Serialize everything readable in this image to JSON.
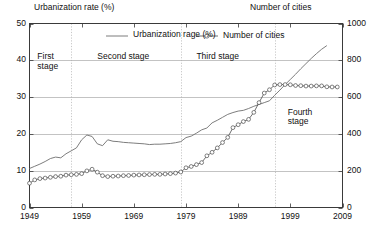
{
  "chart_data": {
    "type": "line",
    "title": "",
    "left_axis": {
      "label": "Urbanization rate (%)",
      "ticks": [
        0,
        10,
        20,
        30,
        40,
        50
      ],
      "ylim": [
        0,
        50
      ]
    },
    "right_axis": {
      "label": "Number of cities",
      "ticks": [
        0,
        200,
        400,
        600,
        800,
        1000
      ],
      "ylim": [
        0,
        1000
      ]
    },
    "xlabel": "",
    "xticks": [
      1949,
      1959,
      1969,
      1979,
      1989,
      1999,
      2009
    ],
    "xlim": [
      1949,
      2009
    ],
    "grid": true,
    "legend": [
      {
        "name": "Urbanization rage (%)",
        "marker": "line",
        "axis": "left"
      },
      {
        "name": "Number of cities",
        "marker": "line-circle",
        "axis": "right"
      }
    ],
    "legend_position": "inside-top",
    "annotations": [
      {
        "text": "First\nstage",
        "x": 1950.5,
        "y_frac": 0.8,
        "span": [
          1949,
          1957
        ]
      },
      {
        "text": "Second stage",
        "x": 1962,
        "y_frac": 0.8,
        "span": [
          1957,
          1978
        ]
      },
      {
        "text": "Third stage",
        "x": 1981,
        "y_frac": 0.8,
        "span": [
          1978,
          1996
        ]
      },
      {
        "text": "Fourth\nstage",
        "x": 1998.5,
        "y_frac": 0.5,
        "span": [
          1996,
          2009
        ]
      }
    ],
    "dividers_x": [
      1957,
      1978,
      1996
    ],
    "series": [
      {
        "name": "Urbanization rage (%)",
        "axis": "left",
        "marker": "none",
        "x": [
          1949,
          1950,
          1951,
          1952,
          1953,
          1954,
          1955,
          1956,
          1957,
          1958,
          1959,
          1960,
          1961,
          1962,
          1963,
          1964,
          1965,
          1966,
          1967,
          1968,
          1969,
          1970,
          1971,
          1972,
          1973,
          1974,
          1975,
          1976,
          1977,
          1978,
          1979,
          1980,
          1981,
          1982,
          1983,
          1984,
          1985,
          1986,
          1987,
          1988,
          1989,
          1990,
          1991,
          1992,
          1993,
          1994,
          1995,
          1996,
          1997,
          1998,
          1999,
          2000,
          2001,
          2002,
          2003,
          2004,
          2005,
          2006
        ],
        "values": [
          10.6,
          11.2,
          11.8,
          12.5,
          13.3,
          13.7,
          13.5,
          14.6,
          15.4,
          16.2,
          18.4,
          19.7,
          19.3,
          17.3,
          16.8,
          18.4,
          18.0,
          17.9,
          17.7,
          17.6,
          17.5,
          17.4,
          17.3,
          17.1,
          17.2,
          17.2,
          17.3,
          17.4,
          17.6,
          17.9,
          19.0,
          19.4,
          20.2,
          21.1,
          21.6,
          23.0,
          23.7,
          24.5,
          25.3,
          25.8,
          26.2,
          26.4,
          26.9,
          27.5,
          28.0,
          28.5,
          29.0,
          30.5,
          31.9,
          33.4,
          34.8,
          36.2,
          37.7,
          39.1,
          40.5,
          41.8,
          43.0,
          44.0
        ],
        "color": "#6e6e6e"
      },
      {
        "name": "Number of cities",
        "axis": "right",
        "marker": "circle",
        "x": [
          1949,
          1950,
          1951,
          1952,
          1953,
          1954,
          1955,
          1956,
          1957,
          1958,
          1959,
          1960,
          1961,
          1962,
          1963,
          1964,
          1965,
          1966,
          1967,
          1968,
          1969,
          1970,
          1971,
          1972,
          1973,
          1974,
          1975,
          1976,
          1977,
          1978,
          1979,
          1980,
          1981,
          1982,
          1983,
          1984,
          1985,
          1986,
          1987,
          1988,
          1989,
          1990,
          1991,
          1992,
          1993,
          1994,
          1995,
          1996,
          1997,
          1998,
          1999,
          2000,
          2001,
          2002,
          2003,
          2004,
          2005,
          2006,
          2007,
          2008
        ],
        "values": [
          132,
          150,
          157,
          160,
          164,
          168,
          170,
          176,
          178,
          180,
          184,
          199,
          208,
          192,
          173,
          168,
          170,
          171,
          173,
          174,
          176,
          177,
          178,
          179,
          180,
          180,
          182,
          184,
          187,
          193,
          216,
          223,
          233,
          244,
          281,
          300,
          324,
          353,
          381,
          434,
          450,
          467,
          479,
          517,
          570,
          622,
          640,
          666,
          668,
          668,
          667,
          663,
          662,
          660,
          660,
          661,
          661,
          656,
          655,
          655
        ],
        "color": "#4a4a4a"
      }
    ]
  }
}
